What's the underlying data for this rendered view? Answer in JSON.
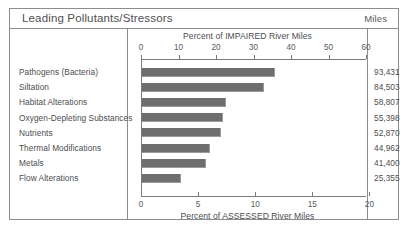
{
  "header": {
    "title": "Leading Pollutants/Stressors",
    "miles_column_label": "Miles"
  },
  "chart_data": {
    "type": "bar",
    "orientation": "horizontal",
    "title": "Leading Pollutants/Stressors",
    "categories": [
      "Pathogens (Bacteria)",
      "Siltation",
      "Habitat Alterations",
      "Oxygen-Depleting Substances",
      "Nutrients",
      "Thermal Modifications",
      "Metals",
      "Flow Alterations"
    ],
    "values": [
      35.5,
      32.5,
      22.5,
      21.5,
      21.0,
      18.0,
      17.0,
      10.5
    ],
    "miles": [
      "93,431",
      "84,503",
      "58,807",
      "55,398",
      "52,870",
      "44,962",
      "41,400",
      "25,355"
    ],
    "top_axis": {
      "label": "Percent of IMPAIRED River Miles",
      "ticks": [
        0,
        10,
        20,
        30,
        40,
        50,
        60
      ],
      "range": [
        0,
        60
      ]
    },
    "bottom_axis": {
      "label": "Percent of ASSESSED River Miles",
      "ticks": [
        0,
        5,
        10,
        15,
        20
      ],
      "range": [
        0,
        19.7
      ]
    },
    "series_color": "#6e6e6e",
    "grid": false,
    "legend": "none",
    "xlabel": "Percent of IMPAIRED River Miles",
    "ylabel": ""
  }
}
